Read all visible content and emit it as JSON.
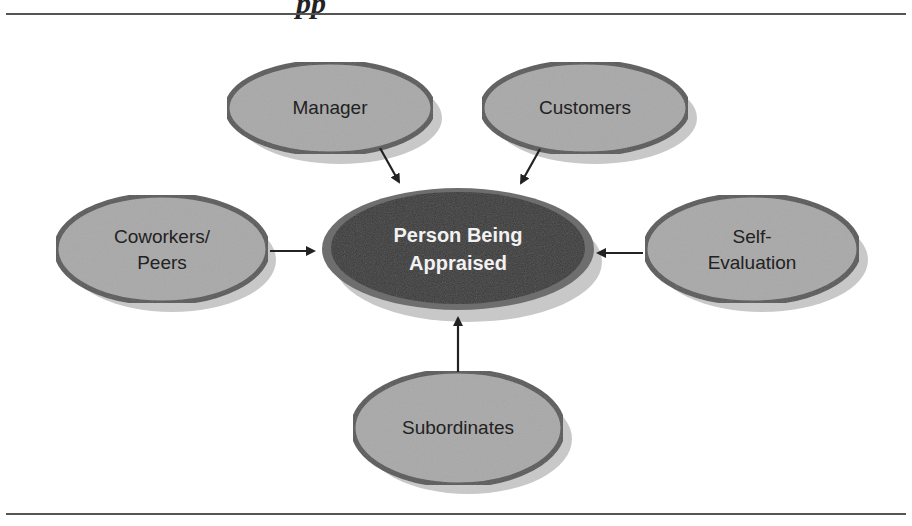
{
  "figure": {
    "title_fragment": "pp",
    "center_node": {
      "line1": "Person Being",
      "line2": "Appraised"
    },
    "nodes": [
      {
        "id": "manager",
        "line1": "Manager",
        "line2": ""
      },
      {
        "id": "customers",
        "line1": "Customers",
        "line2": ""
      },
      {
        "id": "coworkers",
        "line1": "Coworkers/",
        "line2": "Peers"
      },
      {
        "id": "self",
        "line1": "Self-",
        "line2": "Evaluation"
      },
      {
        "id": "subordinates",
        "line1": "Subordinates",
        "line2": ""
      }
    ],
    "colors": {
      "outer_node_fill": "#a9a9a9",
      "outer_node_border": "#5a5a5a",
      "center_node_fill": "#3a3a3a",
      "shadow": "#c8c8c8",
      "arrow": "#222222",
      "rule": "#555555"
    }
  }
}
